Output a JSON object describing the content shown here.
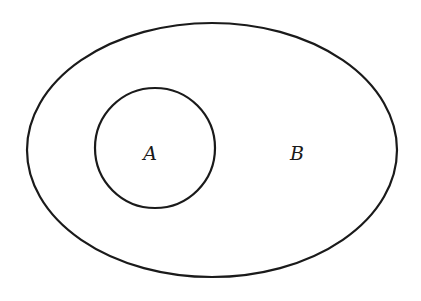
{
  "diagram": {
    "type": "venn",
    "stroke_color": "#1a1a1a",
    "background": "#ffffff",
    "sets": [
      {
        "id": "B",
        "label": "B",
        "shape": "ellipse",
        "contains": [
          "A"
        ]
      },
      {
        "id": "A",
        "label": "A",
        "shape": "circle",
        "inside": "B"
      }
    ]
  }
}
